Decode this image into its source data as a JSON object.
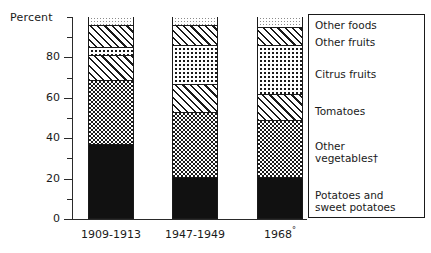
{
  "chart_data": {
    "type": "bar",
    "subtype": "stacked-100-percent",
    "title": "",
    "xlabel": "",
    "ylabel": "Percent",
    "ylim": [
      0,
      100
    ],
    "yticks_major": [
      0,
      20,
      40,
      60,
      80
    ],
    "yticks_minor": [
      10,
      30,
      50,
      70,
      90,
      100
    ],
    "grid": false,
    "legend_position": "right",
    "categories": [
      "1909-1913",
      "1947-1949",
      "1968"
    ],
    "category_marks": [
      "",
      "",
      "°"
    ],
    "series": [
      {
        "name": "Potatoes and sweet potatoes",
        "pattern": "solid-black",
        "values": [
          36,
          20,
          20
        ]
      },
      {
        "name": "Other vegetables†",
        "pattern": "dark-checkerboard",
        "values": [
          32,
          32,
          28
        ]
      },
      {
        "name": "Tomatoes",
        "pattern": "diagonal-hatch",
        "values": [
          12,
          14,
          13
        ]
      },
      {
        "name": "Citrus fruits",
        "pattern": "open-dots",
        "values": [
          4,
          19,
          24
        ]
      },
      {
        "name": "Other fruits",
        "pattern": "diagonal-hatch",
        "values": [
          11,
          10,
          9
        ]
      },
      {
        "name": "Other foods",
        "pattern": "light-stipple",
        "values": [
          5,
          5,
          6
        ]
      }
    ]
  },
  "axis": {
    "y_title": "Percent",
    "tick_labels": [
      "80",
      "60",
      "40",
      "20",
      "0"
    ]
  },
  "x_labels": [
    {
      "text": "1909-1913",
      "mark": ""
    },
    {
      "text": "1947-1949",
      "mark": ""
    },
    {
      "text": "1968",
      "mark": "°"
    }
  ],
  "legend": {
    "items": [
      {
        "label": "Other foods"
      },
      {
        "label": "Other fruits"
      },
      {
        "label": "Citrus fruits"
      },
      {
        "label": "Tomatoes"
      },
      {
        "label": "Other\nvegetables†"
      },
      {
        "label": "Potatoes and\nsweet potatoes"
      }
    ]
  }
}
